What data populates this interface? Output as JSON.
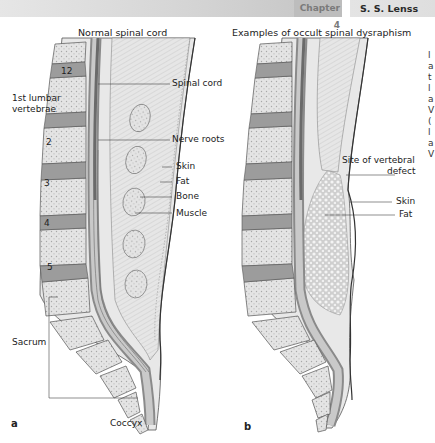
{
  "header": {
    "chapter": "Chapter 4",
    "author": "S. S. Lenss"
  },
  "figure": {
    "panel_a": {
      "letter": "a",
      "title": "Normal spinal cord",
      "left_labels": {
        "l12": "12",
        "lumbar1_line1": "1st lumbar",
        "lumbar1_line2": "vertebrae",
        "l2": "2",
        "l3": "3",
        "l4": "4",
        "l5": "5",
        "sacrum": "Sacrum",
        "coccyx": "Coccyx"
      },
      "right_labels": {
        "spinal_cord": "Spinal cord",
        "nerve_roots": "Nerve roots",
        "skin": "Skin",
        "fat": "Fat",
        "bone": "Bone",
        "muscle": "Muscle"
      }
    },
    "panel_b": {
      "letter": "b",
      "title": "Examples of occult spinal dysraphism",
      "labels": {
        "site_line1": "Site of vertebral",
        "site_line2": "defect",
        "skin": "Skin",
        "fat": "Fat"
      }
    },
    "colors": {
      "vertebra_fill": "#e3e3e3",
      "disc_fill": "#9a9a9a",
      "outline": "#555555",
      "cord_dark": "#8a8a8a",
      "fat_fill": "#d0d0d0"
    }
  },
  "side_text_fragments": [
    "l",
    "a",
    "t",
    "l",
    "a",
    "V",
    "(",
    "l",
    "a",
    "V"
  ]
}
